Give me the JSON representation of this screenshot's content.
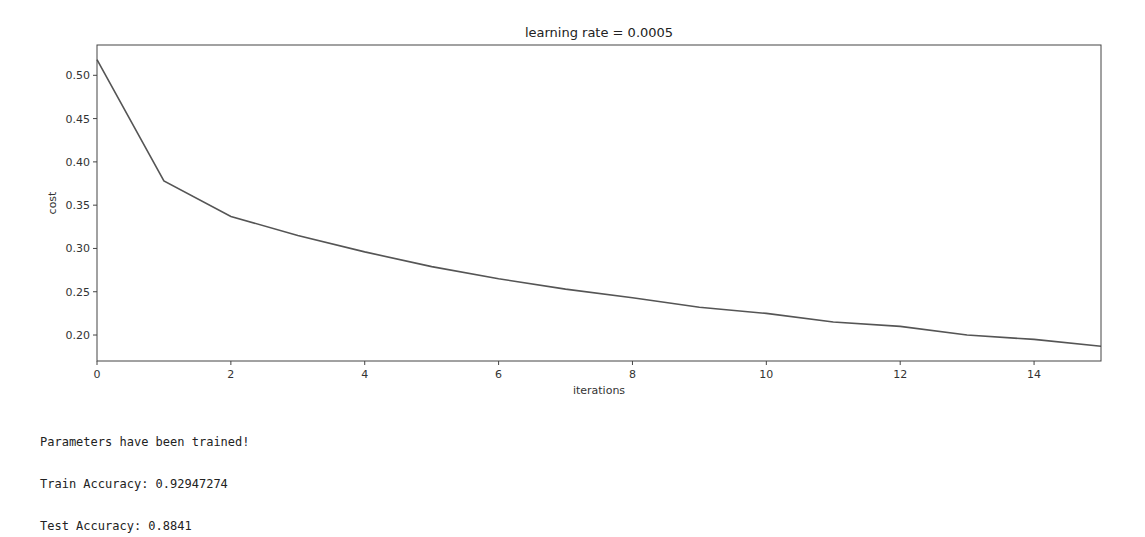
{
  "chart_data": {
    "type": "line",
    "title": "learning rate = 0.0005",
    "xlabel": "iterations",
    "ylabel": "cost",
    "x": [
      0,
      1,
      2,
      3,
      4,
      5,
      6,
      7,
      8,
      9,
      10,
      11,
      12,
      13,
      14,
      15
    ],
    "series": [
      {
        "name": "cost",
        "color": "#555555",
        "values": [
          0.518,
          0.378,
          0.337,
          0.315,
          0.296,
          0.279,
          0.265,
          0.253,
          0.243,
          0.232,
          0.225,
          0.215,
          0.21,
          0.2,
          0.195,
          0.187
        ]
      }
    ],
    "xticks": [
      0,
      2,
      4,
      6,
      8,
      10,
      12,
      14
    ],
    "xtick_labels": [
      "0",
      "2",
      "4",
      "6",
      "8",
      "10",
      "12",
      "14"
    ],
    "yticks": [
      0.2,
      0.25,
      0.3,
      0.35,
      0.4,
      0.45,
      0.5
    ],
    "ytick_labels": [
      "0.20",
      "0.25",
      "0.30",
      "0.35",
      "0.40",
      "0.45",
      "0.50"
    ],
    "xlim": [
      0,
      15
    ],
    "ylim": [
      0.17,
      0.535
    ],
    "grid": false,
    "legend": null
  },
  "output": {
    "lines": [
      "Parameters have been trained!",
      "Train Accuracy: 0.92947274",
      "Test Accuracy: 0.8841"
    ]
  }
}
